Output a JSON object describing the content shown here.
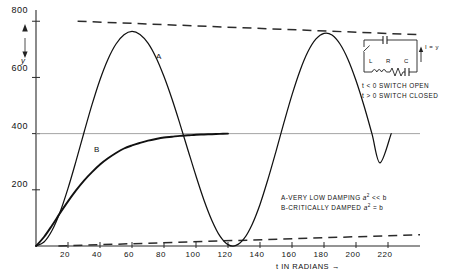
{
  "chart_data": {
    "type": "line",
    "title": "",
    "xlabel": "t IN RADIANS",
    "ylabel": "y",
    "xlim": [
      0,
      240
    ],
    "ylim": [
      0,
      840
    ],
    "xticks": [
      20,
      40,
      60,
      80,
      100,
      120,
      140,
      160,
      180,
      200,
      220
    ],
    "yticks": [
      200,
      400,
      600,
      800
    ],
    "grid": false,
    "gridlines_y": [
      400
    ],
    "legend_position": "lower-right-inset",
    "series": [
      {
        "name": "A",
        "label": "A",
        "description": "very low damping, oscillatory",
        "style": "solid",
        "x": [
          0,
          5,
          10,
          15,
          20,
          25,
          30,
          35,
          40,
          45,
          50,
          55,
          60,
          65,
          70,
          75,
          80,
          85,
          90,
          95,
          100,
          105,
          110,
          115,
          120,
          125,
          130,
          135,
          140,
          145,
          150,
          155,
          160,
          165,
          170,
          175,
          180,
          185,
          190,
          195,
          200,
          205,
          210,
          215,
          222
        ],
        "y": [
          0,
          14,
          55,
          120,
          205,
          302,
          404,
          503,
          592,
          665,
          719,
          752,
          764,
          753,
          722,
          671,
          603,
          523,
          434,
          341,
          249,
          163,
          90,
          35,
          5,
          2,
          26,
          76,
          148,
          238,
          337,
          440,
          538,
          624,
          692,
          737,
          757,
          751,
          719,
          664,
          589,
          499,
          399,
          296,
          400
        ]
      },
      {
        "name": "B",
        "label": "B",
        "description": "critically damped, monotonic rise to asymptote",
        "style": "solid",
        "x": [
          0,
          5,
          10,
          15,
          20,
          25,
          30,
          35,
          40,
          45,
          50,
          55,
          60,
          65,
          70,
          75,
          80,
          85,
          90,
          95,
          100,
          105,
          110,
          115,
          120
        ],
        "y": [
          0,
          32,
          73,
          117,
          159,
          198,
          233,
          263,
          290,
          312,
          331,
          347,
          358,
          367,
          375,
          381,
          386,
          389,
          392,
          394,
          396,
          397,
          398,
          399,
          400
        ]
      }
    ],
    "envelopes": [
      {
        "name": "upper-envelope",
        "style": "dashed",
        "description": "upper exponential decay envelope",
        "x": [
          26,
          240
        ],
        "y": [
          800,
          752
        ]
      },
      {
        "name": "lower-envelope",
        "style": "dashed",
        "description": "lower exponential decay envelope",
        "x": [
          14,
          240
        ],
        "y": [
          0,
          40
        ]
      }
    ],
    "asymptote": {
      "name": "steady-state-line",
      "value": 400,
      "style": "thin-solid",
      "description": "horizontal line at y=400"
    },
    "annotations": [
      {
        "name": "legend-line-a",
        "text": "A-VERY LOW DAMPING",
        "math": "a² << b"
      },
      {
        "name": "legend-line-b",
        "text": "B-CRITICALLY DAMPED",
        "math": "a² = b"
      }
    ]
  },
  "axes": {
    "y_label": "y",
    "x_label": "t IN RADIANS",
    "x_label_arrow": "→",
    "yticks": [
      "200",
      "400",
      "600",
      "800"
    ],
    "xticks": [
      "20",
      "40",
      "60",
      "80",
      "100",
      "120",
      "140",
      "160",
      "180",
      "200",
      "220"
    ]
  },
  "curve_labels": {
    "a": "A",
    "b": "B"
  },
  "legend": {
    "line_a_text": "A-VERY LOW  DAMPING",
    "line_a_cond": "a",
    "line_a_exp": "2",
    "line_a_rel": "<< b",
    "line_b_text": "B-CRITICALLY DAMPED",
    "line_b_cond": "a",
    "line_b_exp": "2",
    "line_b_rel": "= b"
  },
  "circuit": {
    "label_l": "L",
    "label_r": "R",
    "label_c": "C",
    "label_current": "I = y",
    "note_open": "t < 0  SWITCH OPEN",
    "note_closed": "t > 0  SWITCH CLOSED"
  },
  "colors": {
    "ink": "#1a1a1a",
    "axis": "#333333",
    "thin_line": "#8a8a8a",
    "background": "#ffffff"
  }
}
